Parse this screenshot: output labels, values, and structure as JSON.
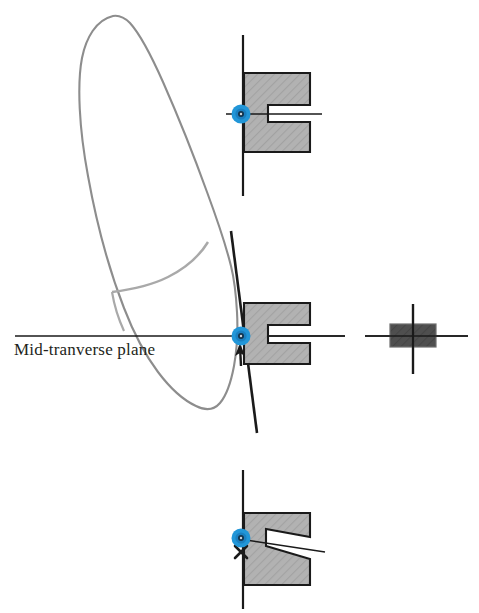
{
  "figure": {
    "title_text": "Mid-tranverse plane",
    "colors": {
      "background": "#ffffff",
      "outline_gray": "#8d8d8d",
      "block_fill": "#b0b0b0",
      "block_stroke": "#1a1a1a",
      "line_black": "#1a1a1a",
      "marker_blue": "#2196d8",
      "marker_blue_dark": "#0b5f8f",
      "marker_core": "#10304a",
      "dark_block_fill": "#4d4d4d",
      "text_color": "#231f20"
    }
  },
  "labels": {
    "mid_transverse_plane": "Mid-tranverse plane"
  },
  "diagrams": [
    {
      "id": "top-bracket",
      "name": "bracket-slot-aligned",
      "marker": "blue-donut-marker",
      "axis": "vertical-line",
      "slot_state": "horizontal-slot",
      "has_arrow": false,
      "has_x_mark": false
    },
    {
      "id": "middle-bracket",
      "name": "bracket-slot-tipped",
      "marker": "blue-donut-marker",
      "axis": "tilted-line",
      "slot_state": "horizontal-slot",
      "has_arrow": true,
      "has_x_mark": false
    },
    {
      "id": "bottom-bracket",
      "name": "bracket-slot-wedge",
      "marker": "blue-donut-marker",
      "axis": "vertical-line",
      "slot_state": "wedge-slot",
      "has_arrow": false,
      "has_x_mark": true
    },
    {
      "id": "right-marker",
      "name": "dark-block-cross",
      "marker": "cross-hair",
      "axis": "cross",
      "slot_state": "solid-block",
      "has_arrow": false,
      "has_x_mark": false
    }
  ],
  "icons": {
    "blue_marker": "blue-donut-marker-icon",
    "arrow_up": "arrow-up-icon",
    "x_mark": "x-mark-icon",
    "crosshair": "crosshair-icon"
  }
}
